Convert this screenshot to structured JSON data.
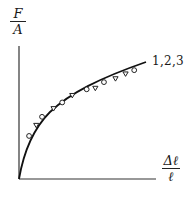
{
  "chart_data": {
    "type": "scatter",
    "title": "",
    "ylabel": {
      "numerator": "F",
      "denominator": "A"
    },
    "xlabel": {
      "numerator": "Δℓ",
      "denominator": "ℓ"
    },
    "series_label": "1,2,3",
    "curve": "monotonic concave increasing (stress–strain), from origin",
    "grid": false,
    "ticks": false,
    "points_circle": [
      [
        0.07,
        0.36
      ],
      [
        0.16,
        0.52
      ],
      [
        0.3,
        0.64
      ],
      [
        0.47,
        0.75
      ],
      [
        0.59,
        0.81
      ],
      [
        0.8,
        0.91
      ]
    ],
    "points_triangle": [
      [
        0.12,
        0.45
      ],
      [
        0.24,
        0.59
      ],
      [
        0.37,
        0.7
      ],
      [
        0.53,
        0.76
      ],
      [
        0.67,
        0.84
      ],
      [
        0.74,
        0.88
      ]
    ]
  }
}
